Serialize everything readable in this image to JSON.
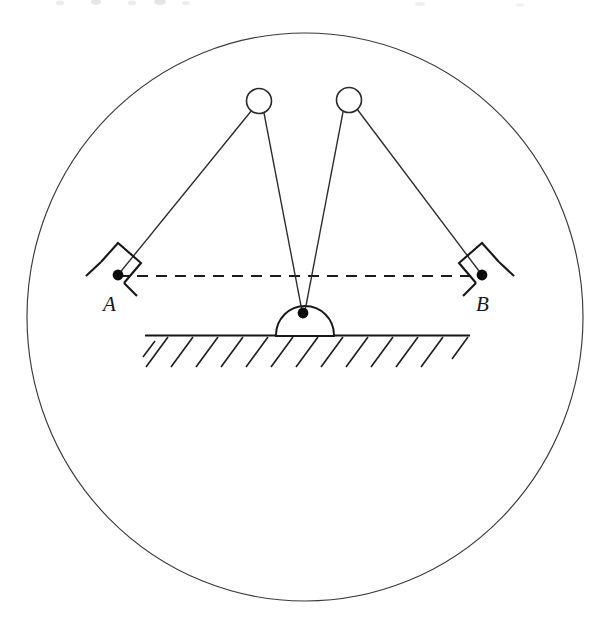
{
  "figure": {
    "background_color": "#ffffff",
    "line_color": "#1c1c1f",
    "accent_color": "#0b0b0d",
    "width": 597,
    "height": 626
  },
  "boundary": {
    "name": "outer-circle",
    "cx": 305,
    "cy": 317,
    "rx": 278,
    "ry": 284,
    "stroke": "#3a3a3e"
  },
  "pulleys": [
    {
      "label": "left-pulley",
      "cx": 259,
      "cy": 101,
      "r": 12.5
    },
    {
      "label": "right-pulley",
      "cx": 349,
      "cy": 100,
      "r": 12.5
    }
  ],
  "pivot": {
    "label": "pivot-point",
    "cx": 303,
    "cy": 313,
    "r": 5.2
  },
  "dome": {
    "label": "semicircular-support",
    "cx": 305,
    "cy": 335,
    "r": 29,
    "base_y": 335
  },
  "ground": {
    "label": "ground-surface",
    "y": 335,
    "x_start": 145,
    "x_end": 470,
    "hatch_count": 13,
    "hatch_spacing": 25,
    "hatch_dx": -22,
    "hatch_dy": 30
  },
  "dashed_axis": {
    "label": "horizontal-reference-line",
    "y": 276,
    "x_start": 118,
    "x_end": 482
  },
  "anchors": [
    {
      "id": "A",
      "label": "A",
      "dot_x": 118,
      "dot_y": 275,
      "dot_r": 5.4,
      "label_x": 112,
      "label_y": 308,
      "bracket": "tilted-square-left"
    },
    {
      "id": "B",
      "label": "B",
      "dot_x": 482,
      "dot_y": 275,
      "dot_r": 5.4,
      "label_x": 478,
      "label_y": 308,
      "bracket": "tilted-square-right"
    }
  ],
  "strings": [
    {
      "label": "string-a-to-left-pulley",
      "x1": 118,
      "y1": 275,
      "x2": 255,
      "y2": 112
    },
    {
      "label": "string-left-pulley-to-pivot",
      "x1": 262,
      "y1": 113,
      "x2": 301,
      "y2": 311
    },
    {
      "label": "string-b-to-right-pulley",
      "x1": 482,
      "y1": 275,
      "x2": 354,
      "y2": 111
    },
    {
      "label": "string-right-pulley-to-pivot",
      "x1": 345,
      "y1": 112,
      "x2": 305,
      "y2": 311
    }
  ],
  "artifacts": {
    "top_ghost_text": "",
    "note": "faint scan residue along top edge"
  }
}
